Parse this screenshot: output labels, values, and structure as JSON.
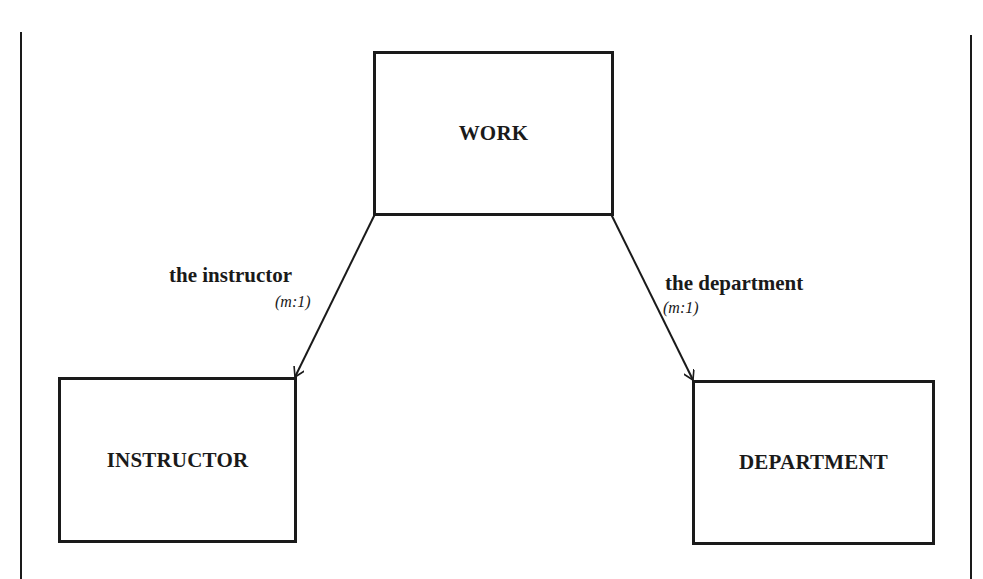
{
  "diagram": {
    "type": "entity-relationship",
    "entities": [
      {
        "id": "work",
        "label": "WORK"
      },
      {
        "id": "instructor",
        "label": "INSTRUCTOR"
      },
      {
        "id": "department",
        "label": "DEPARTMENT"
      }
    ],
    "relationships": [
      {
        "from": "work",
        "to": "instructor",
        "label": "the instructor",
        "cardinality": "(m:1)"
      },
      {
        "from": "work",
        "to": "department",
        "label": "the department",
        "cardinality": "(m:1)"
      }
    ],
    "colors": {
      "stroke": "#1a1a1a",
      "background": "#ffffff"
    }
  }
}
